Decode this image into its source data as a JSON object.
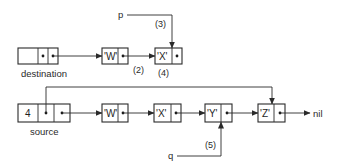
{
  "diagram": {
    "top_list": {
      "header_label": "destination",
      "nodes": [
        {
          "value": "'W'"
        },
        {
          "value": "'X'"
        }
      ]
    },
    "bottom_list": {
      "header_label": "source",
      "header_count": "4",
      "nodes": [
        {
          "value": "'W'"
        },
        {
          "value": "'X'"
        },
        {
          "value": "'Y'"
        },
        {
          "value": "'Z'"
        }
      ],
      "terminator": "nil"
    },
    "pointers": {
      "p": "p",
      "q": "q"
    },
    "step_labels": {
      "s2": "(2)",
      "s3": "(3)",
      "s4": "(4)",
      "s5": "(5)"
    }
  }
}
